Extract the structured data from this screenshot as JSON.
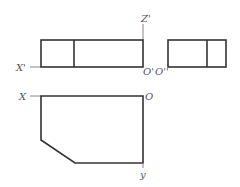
{
  "diagram": {
    "type": "orthographic-projection",
    "labels": {
      "z_prime": "Z'",
      "x_prime": "X'",
      "o_prime": "O'",
      "o_double_prime": "O''",
      "x": "X",
      "o": "O",
      "y": "y"
    },
    "views": {
      "front": {
        "x": 41,
        "y": 40,
        "w": 102,
        "h": 27,
        "divider_x": 74
      },
      "side": {
        "x": 168,
        "y": 40,
        "w": 58,
        "h": 27,
        "divider_x": 207
      },
      "top": {
        "points": "41,96 143,96 143,163 75,163 41,140"
      }
    },
    "colors": {
      "edge": "#333333",
      "axis": "#888888",
      "label": "#555555"
    }
  }
}
